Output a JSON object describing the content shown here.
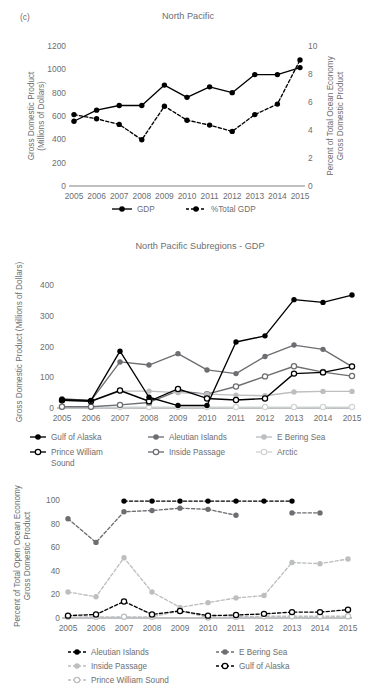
{
  "figure": {
    "panel_label": "(c)",
    "background": "#ffffff",
    "text_color": "#6d6e71"
  },
  "colors": {
    "black": "#000000",
    "dark_gray": "#6d6e71",
    "mid_gray": "#939598",
    "light_gray": "#bcbec0",
    "pale_gray": "#d1d3d4",
    "axis": "#808285"
  },
  "chart_data": [
    {
      "id": "north-pacific-gdp",
      "type": "line",
      "title": "North Pacific",
      "xlabel": "",
      "ylabel": "Gross Domestic Product\n(Millions of Dollars)",
      "ylabel_line1": "Gross Domestic Product",
      "ylabel_line2": "(Millions of Dollars)",
      "y2label_line1": "Percent of Total Ocean Economy",
      "y2label_line2": "Gross Domestic Product",
      "categories": [
        "2005",
        "2006",
        "2007",
        "2008",
        "2009",
        "2010",
        "2011",
        "2012",
        "2013",
        "2014",
        "2015"
      ],
      "ylim": [
        0,
        1200
      ],
      "yticks": [
        0,
        200,
        400,
        600,
        800,
        1000,
        1200
      ],
      "y2lim": [
        0,
        10
      ],
      "y2ticks": [
        0,
        2,
        4,
        6,
        8,
        10
      ],
      "grid": false,
      "legend_position": "bottom",
      "series": [
        {
          "name": "GDP",
          "axis": "left",
          "style": "solid",
          "marker": "filled-circle",
          "color": "#000000",
          "values": [
            555,
            650,
            690,
            690,
            865,
            760,
            850,
            800,
            955,
            955,
            1015
          ]
        },
        {
          "name": "%Total GDP",
          "axis": "right",
          "style": "dashed",
          "marker": "filled-circle",
          "color": "#000000",
          "values": [
            5.1,
            4.8,
            4.4,
            3.3,
            5.7,
            4.7,
            4.35,
            3.9,
            5.1,
            5.85,
            9.0
          ]
        }
      ]
    },
    {
      "id": "north-pacific-subregions-gdp",
      "type": "line",
      "title": "North Pacific Subregions - GDP",
      "xlabel": "",
      "ylabel": "Gross Domestic Product (Millions of Dollars)",
      "categories": [
        "2005",
        "2006",
        "2007",
        "2008",
        "2009",
        "2010",
        "2011",
        "2012",
        "2013",
        "2014",
        "2015"
      ],
      "ylim": [
        0,
        430
      ],
      "yticks": [
        0,
        100,
        200,
        300,
        400
      ],
      "grid": false,
      "legend_position": "bottom",
      "series": [
        {
          "name": "Gulf of Alaska",
          "style": "solid",
          "marker": "filled-circle",
          "color": "#000000",
          "values": [
            27,
            25,
            185,
            35,
            8,
            8,
            215,
            235,
            353,
            344,
            368
          ]
        },
        {
          "name": "Aleutian Islands",
          "style": "solid",
          "marker": "filled-circle",
          "color": "#6d6e71",
          "values": [
            30,
            24,
            150,
            140,
            177,
            124,
            112,
            168,
            205,
            191,
            135
          ]
        },
        {
          "name": "E Bering Sea",
          "style": "solid",
          "marker": "filled-circle",
          "color": "#bcbec0",
          "values": [
            25,
            22,
            55,
            55,
            50,
            45,
            42,
            40,
            52,
            54,
            54
          ]
        },
        {
          "name": "Prince William Sound",
          "style": "solid",
          "marker": "open-circle",
          "color": "#000000",
          "values": [
            25,
            22,
            57,
            22,
            62,
            31,
            26,
            31,
            112,
            116,
            135
          ]
        },
        {
          "name": "Inside Passage",
          "style": "solid",
          "marker": "open-circle",
          "color": "#6d6e71",
          "values": [
            4,
            4,
            10,
            18,
            56,
            45,
            70,
            103,
            136,
            117,
            104
          ]
        },
        {
          "name": "Arctic",
          "style": "solid",
          "marker": "open-circle",
          "color": "#d1d3d4",
          "values": [
            3,
            3,
            3,
            3,
            3,
            3,
            3,
            3,
            3,
            3,
            3
          ]
        }
      ]
    },
    {
      "id": "north-pacific-subregions-percent",
      "type": "line",
      "title": "",
      "xlabel": "",
      "ylabel_line1": "Percent of Total Open Ocean Economy",
      "ylabel_line2": "Gross Domestic Product",
      "categories": [
        "2005",
        "2006",
        "2007",
        "2008",
        "2009",
        "2010",
        "2011",
        "2012",
        "2013",
        "2014",
        "2015"
      ],
      "ylim": [
        0,
        105
      ],
      "yticks": [
        0,
        20,
        40,
        60,
        80,
        100
      ],
      "grid": false,
      "legend_position": "bottom",
      "series": [
        {
          "name": "Aleutian Islands",
          "style": "dashed",
          "marker": "filled-circle",
          "color": "#000000",
          "values": [
            null,
            null,
            99,
            99,
            99,
            99,
            99,
            99,
            99,
            null,
            null
          ]
        },
        {
          "name": "E Bering Sea",
          "style": "dashed",
          "marker": "filled-circle",
          "color": "#6d6e71",
          "values": [
            84,
            64,
            90,
            91,
            93,
            92,
            87,
            null,
            89,
            89,
            null
          ]
        },
        {
          "name": "Inside Passage",
          "style": "dashed",
          "marker": "filled-circle",
          "color": "#bcbec0",
          "values": [
            22,
            18,
            51,
            22,
            9,
            13,
            17,
            19,
            47,
            46,
            50
          ]
        },
        {
          "name": "Gulf of Alaska",
          "style": "dashed",
          "marker": "open-circle",
          "color": "#000000",
          "values": [
            2,
            3,
            14,
            3,
            6,
            2,
            2.5,
            3.5,
            5,
            5,
            7
          ]
        },
        {
          "name": "Prince William Sound",
          "style": "dashed",
          "marker": "open-circle",
          "color": "#bcbec0",
          "values": [
            1,
            1,
            1,
            1,
            6,
            0.5,
            1,
            1.5,
            1.5,
            1.5,
            1.5
          ]
        }
      ]
    }
  ],
  "legends": {
    "top": [
      {
        "label": "GDP",
        "style": "solid",
        "marker": "filled-circle",
        "color": "#000000"
      },
      {
        "label": "%Total GDP",
        "style": "dashed",
        "marker": "filled-circle",
        "color": "#000000"
      }
    ],
    "mid": [
      {
        "label": "Gulf of Alaska",
        "style": "solid",
        "marker": "filled-circle",
        "color": "#000000"
      },
      {
        "label": "Aleutian Islands",
        "style": "solid",
        "marker": "filled-circle",
        "color": "#6d6e71"
      },
      {
        "label": "E Bering Sea",
        "style": "solid",
        "marker": "filled-circle",
        "color": "#bcbec0"
      },
      {
        "label": "Prince William",
        "label2": "Sound",
        "style": "solid",
        "marker": "open-circle",
        "color": "#000000"
      },
      {
        "label": "Inside Passage",
        "style": "solid",
        "marker": "open-circle",
        "color": "#6d6e71"
      },
      {
        "label": "Arctic",
        "style": "solid",
        "marker": "open-circle",
        "color": "#d1d3d4"
      }
    ],
    "bot": [
      {
        "label": "Aleutian Islands",
        "style": "dashed",
        "marker": "filled-circle",
        "color": "#000000"
      },
      {
        "label": "E Bering Sea",
        "style": "dashed",
        "marker": "filled-circle",
        "color": "#6d6e71"
      },
      {
        "label": "Inside Passage",
        "style": "dashed",
        "marker": "filled-circle",
        "color": "#bcbec0"
      },
      {
        "label": "Gulf of Alaska",
        "style": "dashed",
        "marker": "open-circle",
        "color": "#000000"
      },
      {
        "label": "Prince William Sound",
        "style": "dashed",
        "marker": "open-circle",
        "color": "#bcbec0"
      }
    ]
  }
}
